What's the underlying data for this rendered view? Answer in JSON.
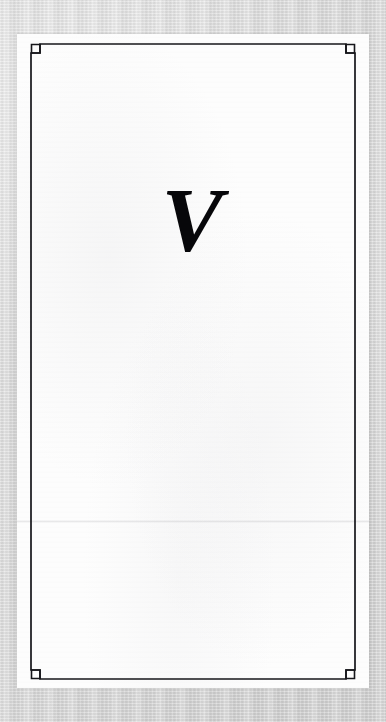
{
  "document": {
    "kind": "scanned-book-page",
    "page_type": "part-title-page",
    "page_body_text": ""
  },
  "colors": {
    "scan_background": "#d9d9d9",
    "paper": "#fdfdfd",
    "frame_rule": "#16161a",
    "numeral_ink": "#07070a"
  },
  "frame": {
    "name": "ruled-border-with-stepped-corners",
    "corner_ornament": "stepped-notch-with-open-square",
    "rule_width_px": 1.6,
    "corners": [
      "top-left",
      "top-right",
      "bottom-right",
      "bottom-left"
    ]
  },
  "content": {
    "part_numeral": "V",
    "numeral_system": "roman",
    "numeral_value": 5,
    "style": "italic-serif-display"
  },
  "artifacts": {
    "fold_line": "horizontal scanner seam across the sheet",
    "paper_grain": "light mottled scan noise"
  }
}
